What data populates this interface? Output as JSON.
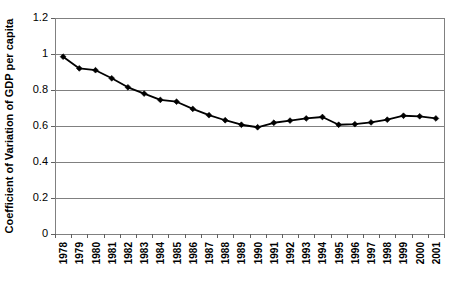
{
  "chart_data": {
    "type": "line",
    "title": "",
    "subtitle": "",
    "xlabel": "",
    "ylabel": "Coefficient of Variation of GDP per capita",
    "categories": [
      "1978",
      "1979",
      "1980",
      "1981",
      "1982",
      "1983",
      "1984",
      "1985",
      "1986",
      "1987",
      "1988",
      "1989",
      "1990",
      "1991",
      "1992",
      "1993",
      "1994",
      "1995",
      "1996",
      "1997",
      "1998",
      "1999",
      "2000",
      "2001"
    ],
    "x": [
      1978,
      1979,
      1980,
      1981,
      1982,
      1983,
      1984,
      1985,
      1986,
      1987,
      1988,
      1989,
      1990,
      1991,
      1992,
      1993,
      1994,
      1995,
      1996,
      1997,
      1998,
      1999,
      2000,
      2001
    ],
    "values": [
      0.985,
      0.92,
      0.91,
      0.865,
      0.815,
      0.78,
      0.745,
      0.735,
      0.695,
      0.66,
      0.632,
      0.607,
      0.593,
      0.618,
      0.63,
      0.642,
      0.65,
      0.607,
      0.61,
      0.62,
      0.635,
      0.657,
      0.654,
      0.642
    ],
    "series": [
      {
        "name": "Coefficient of Variation of GDP per capita",
        "values": [
          0.985,
          0.92,
          0.91,
          0.865,
          0.815,
          0.78,
          0.745,
          0.735,
          0.695,
          0.66,
          0.632,
          0.607,
          0.593,
          0.618,
          0.63,
          0.642,
          0.65,
          0.607,
          0.61,
          0.62,
          0.635,
          0.657,
          0.654,
          0.642
        ],
        "color": "#000000",
        "marker": "diamond"
      }
    ],
    "ylim": [
      0,
      1.2
    ],
    "yticks": [
      0,
      0.2,
      0.4,
      0.6,
      0.8,
      1,
      1.2
    ],
    "ytick_labels": [
      "0",
      "0.2",
      "0.4",
      "0.6",
      "0.8",
      "1",
      "1.2"
    ],
    "xtick_rotation": 90,
    "grid": {
      "horizontal": true,
      "vertical": false,
      "color": "#808080"
    },
    "legend": {
      "visible": false,
      "position": "none"
    },
    "plot_area": {
      "left": 55,
      "top": 18,
      "right": 444,
      "bottom": 234
    },
    "background_color": "#ffffff",
    "frame_color": "#808080",
    "annotations": []
  }
}
